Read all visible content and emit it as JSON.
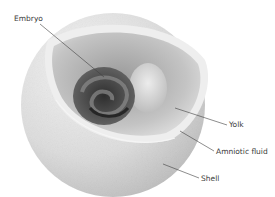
{
  "diagram": {
    "labels": [
      {
        "id": "embryo",
        "text": "Embryo",
        "x": 14,
        "y": 19
      },
      {
        "id": "yolk",
        "text": "Yolk",
        "x": 229,
        "y": 122
      },
      {
        "id": "amniotic-fluid",
        "text": "Amniotic fluid",
        "x": 216,
        "y": 148
      },
      {
        "id": "shell",
        "text": "Shell",
        "x": 201,
        "y": 175
      }
    ],
    "colors": {
      "shell": "#d6d6d6",
      "shell_highlight": "#f2f2f2",
      "inner_cavity": "#bdbdbd",
      "embryo": "#4a4a4a",
      "yolk": "#d9d9d9",
      "leader_line": "#404040",
      "label_text": "#3a3a3a"
    }
  }
}
